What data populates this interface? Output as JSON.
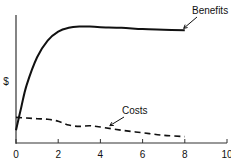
{
  "chart_data": {
    "type": "line",
    "title": "",
    "xlabel": "",
    "ylabel": "$",
    "xlim": [
      0,
      10
    ],
    "ylim": [
      0,
      100
    ],
    "x_ticks": [
      "0",
      "2",
      "4",
      "6",
      "8",
      "10"
    ],
    "grid": false,
    "legend": "inline annotations with arrows",
    "series": [
      {
        "name": "Benefits",
        "style": "solid",
        "x": [
          0,
          0.25,
          0.5,
          1,
          1.5,
          2,
          2.5,
          3,
          3.5,
          4,
          5,
          6,
          7,
          8
        ],
        "y": [
          10,
          28,
          45,
          67,
          80,
          87,
          90,
          91,
          91,
          90.5,
          90,
          89,
          88.5,
          88
        ]
      },
      {
        "name": "Costs",
        "style": "dashed",
        "x": [
          0,
          0.5,
          1,
          1.5,
          2,
          2.5,
          3,
          3.5,
          4,
          5,
          6,
          7,
          8
        ],
        "y": [
          20,
          19.5,
          19,
          18.5,
          17,
          14,
          13,
          13.5,
          12.5,
          10,
          8,
          6,
          5
        ]
      }
    ],
    "annotations": [
      {
        "text": "Benefits",
        "arrow_to": [
          7.9,
          88
        ]
      },
      {
        "text": "Costs",
        "arrow_to": [
          4.4,
          12
        ]
      }
    ]
  }
}
